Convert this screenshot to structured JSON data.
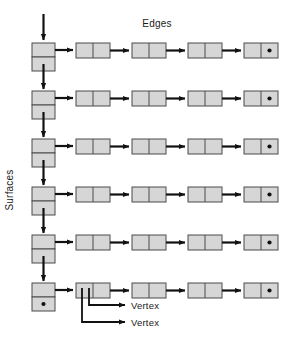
{
  "diagram": {
    "type": "linked-list-structure",
    "title_top": "Edges",
    "title_left": "Surfaces",
    "callouts": [
      {
        "label": "Vertex"
      },
      {
        "label": "Vertex"
      }
    ],
    "colors": {
      "node_fill": "#d6d6d6",
      "node_stroke": "#4a4a4a",
      "arrow": "#111111",
      "text": "#1a1a1a",
      "background": "#ffffff"
    },
    "surface_chain": {
      "name": "Surfaces",
      "node_count": 6,
      "node_shape": "two-cell-vertical",
      "has_incoming_head_arrow": true,
      "terminal_null_marker": "dot",
      "nodes": [
        {
          "index": 0,
          "next_pointer": "arrow-down",
          "edge_pointer": "arrow-right"
        },
        {
          "index": 1,
          "next_pointer": "arrow-down",
          "edge_pointer": "arrow-right"
        },
        {
          "index": 2,
          "next_pointer": "arrow-down",
          "edge_pointer": "arrow-right"
        },
        {
          "index": 3,
          "next_pointer": "arrow-down",
          "edge_pointer": "arrow-right"
        },
        {
          "index": 4,
          "next_pointer": "arrow-down",
          "edge_pointer": "arrow-right"
        },
        {
          "index": 5,
          "next_pointer": "null-dot",
          "edge_pointer": "arrow-right"
        }
      ]
    },
    "edge_rows": {
      "name": "Edges",
      "row_count": 6,
      "nodes_per_row": 4,
      "node_shape": "two-cell-horizontal",
      "terminal_null_marker": "dot",
      "rows": [
        {
          "index": 0,
          "nodes": [
            {
              "index": 0,
              "next_pointer": "arrow-right"
            },
            {
              "index": 1,
              "next_pointer": "arrow-right"
            },
            {
              "index": 2,
              "next_pointer": "arrow-right"
            },
            {
              "index": 3,
              "next_pointer": "null-dot"
            }
          ]
        },
        {
          "index": 1,
          "nodes": [
            {
              "index": 0,
              "next_pointer": "arrow-right"
            },
            {
              "index": 1,
              "next_pointer": "arrow-right"
            },
            {
              "index": 2,
              "next_pointer": "arrow-right"
            },
            {
              "index": 3,
              "next_pointer": "null-dot"
            }
          ]
        },
        {
          "index": 2,
          "nodes": [
            {
              "index": 0,
              "next_pointer": "arrow-right"
            },
            {
              "index": 1,
              "next_pointer": "arrow-right"
            },
            {
              "index": 2,
              "next_pointer": "arrow-right"
            },
            {
              "index": 3,
              "next_pointer": "null-dot"
            }
          ]
        },
        {
          "index": 3,
          "nodes": [
            {
              "index": 0,
              "next_pointer": "arrow-right"
            },
            {
              "index": 1,
              "next_pointer": "arrow-right"
            },
            {
              "index": 2,
              "next_pointer": "arrow-right"
            },
            {
              "index": 3,
              "next_pointer": "null-dot"
            }
          ]
        },
        {
          "index": 4,
          "nodes": [
            {
              "index": 0,
              "next_pointer": "arrow-right"
            },
            {
              "index": 1,
              "next_pointer": "arrow-right"
            },
            {
              "index": 2,
              "next_pointer": "arrow-right"
            },
            {
              "index": 3,
              "next_pointer": "null-dot"
            }
          ]
        },
        {
          "index": 5,
          "nodes": [
            {
              "index": 0,
              "next_pointer": "arrow-right"
            },
            {
              "index": 1,
              "next_pointer": "arrow-right"
            },
            {
              "index": 2,
              "next_pointer": "arrow-right"
            },
            {
              "index": 3,
              "next_pointer": "null-dot"
            }
          ]
        }
      ]
    }
  }
}
